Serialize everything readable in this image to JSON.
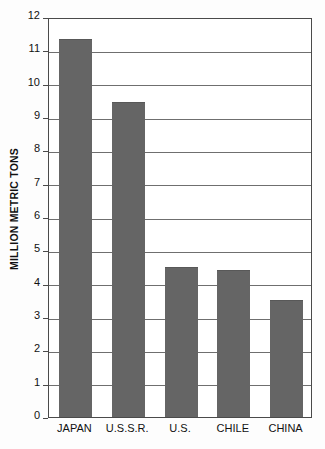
{
  "chart_data": {
    "type": "bar",
    "title": "",
    "subtitle": "",
    "xlabel": "",
    "ylabel": "MILLION METRIC TONS",
    "categories": [
      "JAPAN",
      "U.S.S.R.",
      "U.S.",
      "CHILE",
      "CHINA"
    ],
    "values": [
      11.35,
      9.45,
      4.5,
      4.4,
      3.5
    ],
    "ylim": [
      0,
      12
    ],
    "ytick_labels": [
      "0",
      "1",
      "2",
      "3",
      "4",
      "5",
      "6",
      "7",
      "8",
      "9",
      "10",
      "11",
      "12"
    ],
    "ytick_values": [
      0,
      1,
      2,
      3,
      4,
      5,
      6,
      7,
      8,
      9,
      10,
      11,
      12
    ],
    "grid": true,
    "grid_axis": "y",
    "legend": false,
    "legend_position": "none",
    "bar_color": "#656565",
    "axis_color": "#4a4a4a",
    "grid_color": "#6f6f6f",
    "background_color": "#ffffff",
    "text_color": "#111111"
  }
}
